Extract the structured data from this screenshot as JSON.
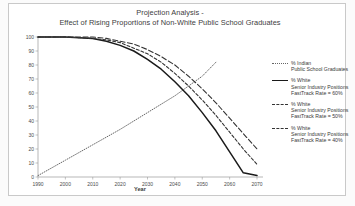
{
  "chart_data": {
    "type": "line",
    "title": "Projection Analysis -",
    "subtitle": "Effect of Rising Proportions of Non-White Public School Graduates",
    "xlabel": "Year",
    "ylabel": "",
    "xlim": [
      1990,
      2070
    ],
    "ylim": [
      0,
      100
    ],
    "xticks": [
      "1990",
      "2000",
      "2010",
      "2020",
      "2030",
      "2040",
      "2050",
      "2060",
      "2070"
    ],
    "yticks": [
      "0",
      "10",
      "20",
      "30",
      "40",
      "50",
      "60",
      "70",
      "80",
      "90",
      "100"
    ],
    "grid": false,
    "legend_position": "right",
    "series": [
      {
        "name": "% Indian",
        "label_line1": "% Indian",
        "label_line2": "Public School Graduates",
        "label_line3": "",
        "style": "dotted",
        "color": "#666666",
        "x": [
          1990,
          2000,
          2010,
          2020,
          2030,
          2040,
          2050,
          2055
        ],
        "values": [
          1,
          12,
          23,
          34,
          46,
          58,
          72,
          82
        ]
      },
      {
        "name": "% White FastTrack 60",
        "label_line1": "% White",
        "label_line2": "Senior Industry Positions",
        "label_line3": "FastTrack Rate = 60%",
        "style": "solid",
        "color": "#1a1a1a",
        "x": [
          1990,
          2000,
          2010,
          2015,
          2020,
          2025,
          2030,
          2035,
          2040,
          2045,
          2050,
          2055,
          2060,
          2065,
          2070
        ],
        "values": [
          100,
          100,
          99,
          97,
          94,
          90,
          84,
          77,
          68,
          58,
          46,
          33,
          18,
          3,
          1
        ]
      },
      {
        "name": "% White FastTrack 50",
        "label_line1": "% White",
        "label_line2": "Senior Industry Positions",
        "label_line3": "FastTrack Rate = 50%",
        "style": "dashed",
        "color": "#333333",
        "x": [
          1990,
          2000,
          2010,
          2015,
          2020,
          2025,
          2030,
          2035,
          2040,
          2045,
          2050,
          2055,
          2060,
          2065,
          2070
        ],
        "values": [
          100,
          100,
          99,
          98,
          96,
          92,
          88,
          82,
          74,
          65,
          55,
          44,
          32,
          20,
          9
        ]
      },
      {
        "name": "% White FastTrack 40",
        "label_line1": "% White",
        "label_line2": "Senior Industry Positions",
        "label_line3": "FastTrack Rate = 40%",
        "style": "longdash",
        "color": "#333333",
        "x": [
          1990,
          2000,
          2010,
          2015,
          2020,
          2025,
          2030,
          2035,
          2040,
          2045,
          2050,
          2055,
          2060,
          2065,
          2070
        ],
        "values": [
          100,
          100,
          100,
          99,
          97,
          95,
          91,
          86,
          80,
          72,
          63,
          53,
          42,
          31,
          20
        ]
      }
    ]
  },
  "chart": {
    "title_line1": "Projection Analysis -",
    "title_line2": "Effect of Rising Proportions of Non-White Public School Graduates",
    "xaxis_title": "Year"
  },
  "legend": {
    "entries": [
      {
        "line1": "% Indian",
        "line2": "Public School Graduates",
        "line3": ""
      },
      {
        "line1": "% White",
        "line2": "Senior Industry Positions",
        "line3": "FastTrack Rate = 60%"
      },
      {
        "line1": "% White",
        "line2": "Senior Industry Positions",
        "line3": "FastTrack Rate = 50%"
      },
      {
        "line1": "% White",
        "line2": "Senior Industry Positions",
        "line3": "FastTrack Rate = 40%"
      }
    ]
  }
}
